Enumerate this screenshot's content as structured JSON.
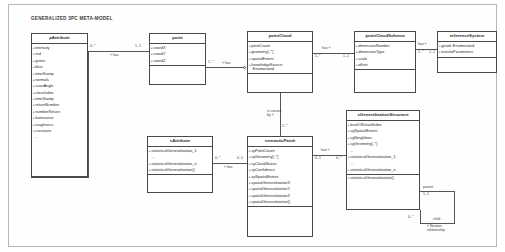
{
  "title": "GENERALIZED 3PC META-MODEL",
  "classes": {
    "p_attribute": {
      "name": "pAttribute",
      "attributes": [
        "intensity",
        "red",
        "green",
        "blue",
        "timeStamp",
        "normals",
        "scanAngle",
        "classIndex",
        "timeStamp",
        "returnNumber",
        "numberReturn",
        "iluminance",
        "roughness",
        "curvature",
        "..."
      ]
    },
    "point": {
      "name": "point",
      "attributes": [
        "coordX",
        "coordY",
        "coordZ"
      ]
    },
    "point_cloud": {
      "name": "pointCloud",
      "attributes": [
        "pointCount",
        "geometry[..*]",
        "spatialExtent",
        "knowledgeSource:",
        "Enumerated"
      ]
    },
    "point_cloud_schema": {
      "name": "pointCloudSchema",
      "attributes": [
        "dimensionNumber",
        "dimensionType",
        "scale",
        "offset"
      ]
    },
    "reference_system": {
      "name": "referenceSystem",
      "attributes": [
        "geoid: Enumerated",
        "transfoParameters"
      ]
    },
    "s_attribute": {
      "name": "sAttribute",
      "attributes": [
        "statisticalGeneralization_1",
        "...",
        "statisticalGeneralization_n",
        "statisticalGeneralization()"
      ]
    },
    "semantic_patch": {
      "name": "semanticPatch",
      "attributes": [
        "spPointCount",
        "spGeometry[..*]",
        "spCloudStatus",
        "spConfidence",
        "spSpatialExtent",
        "spatialGeneralizationX",
        "spatialGeneralizationY",
        "spatialGeneralizationZ",
        "spatialGeneralization()"
      ]
    },
    "s_generalization_structure": {
      "name": "sGeneralizationStructure",
      "attributes": [
        "levelOfDetailIndex",
        "sgSpatialExtent",
        "sgNeighbors",
        "sgGeometry[..*]",
        "...",
        "statisticalGeneralization_1",
        "...",
        "statisticalGeneralization_n",
        "statisticalGeneralization()"
      ]
    }
  },
  "relations": {
    "p_attribute_point": {
      "role": "« has",
      "source_mult": "0..*",
      "target_mult": "1..1"
    },
    "point_point_cloud": {
      "role": "« has",
      "source_mult": "1..*"
    },
    "point_cloud_schema_rel": {
      "role": "has »",
      "source_mult": "1..*",
      "target_mult": "1..1"
    },
    "schema_reference_system": {
      "role": "has »",
      "source_mult": "1..*",
      "target_mult": "1..1"
    },
    "point_cloud_semantic_patch": {
      "role": "is carried",
      "role2": "by »",
      "source_mult": "1..*"
    },
    "s_attribute_semantic_patch": {
      "role": "« has",
      "source_mult": "0..*",
      "target_mult": "0..1"
    },
    "semantic_patch_generalization": {
      "role": "has »",
      "source_mult": "0..1",
      "target_mult": "0..*"
    },
    "generalization_self": {
      "role_parent": "parent",
      "role_child": "« Nestion",
      "role_child2": "relationship",
      "role_child_label": "child",
      "parent_mult": "1..1",
      "child_mult": "0..*"
    }
  }
}
